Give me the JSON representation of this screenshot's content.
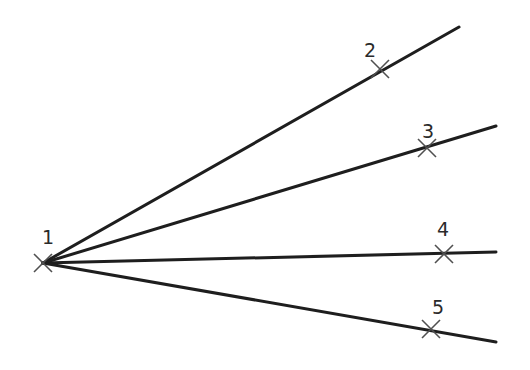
{
  "diagram": {
    "colors": {
      "background": "#ffffff",
      "line": "#1e1e1e",
      "marker": "#505050",
      "label": "#2a2a2a"
    },
    "origin": {
      "id": "1",
      "label": "1",
      "x": 43,
      "y": 263,
      "label_x": 42,
      "label_y": 244
    },
    "points": [
      {
        "id": "2",
        "label": "2",
        "x": 380,
        "y": 69,
        "label_x": 364,
        "label_y": 57,
        "ray_end": {
          "x": 459,
          "y": 27
        }
      },
      {
        "id": "3",
        "label": "3",
        "x": 427,
        "y": 148,
        "label_x": 422,
        "label_y": 138,
        "ray_end": {
          "x": 496,
          "y": 126
        }
      },
      {
        "id": "4",
        "label": "4",
        "x": 444,
        "y": 254,
        "label_x": 437,
        "label_y": 236,
        "ray_end": {
          "x": 496,
          "y": 252
        }
      },
      {
        "id": "5",
        "label": "5",
        "x": 431,
        "y": 329,
        "label_x": 432,
        "label_y": 314,
        "ray_end": {
          "x": 496,
          "y": 342
        }
      }
    ]
  }
}
